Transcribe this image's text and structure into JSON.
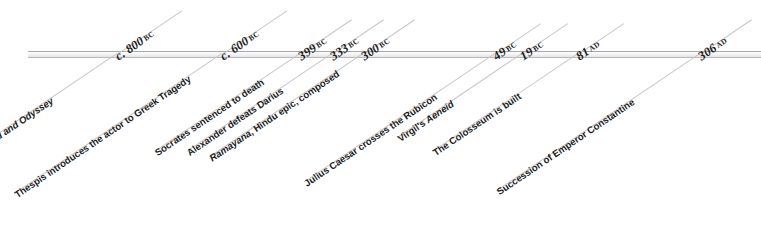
{
  "figure": {
    "axis_color": "#a9a9ad",
    "leader_color": "#c6c6ca",
    "text_color": "#1c1c1c",
    "rotation_degrees": -34
  },
  "events": [
    {
      "date_value": "c. 800",
      "era": "BC",
      "label_prefix": "Homer's ",
      "label_italic": "Iliad and Odyssey",
      "label_suffix": "",
      "label_plain": "Homer's Iliad and Odyssey"
    },
    {
      "date_value": "c. 600",
      "era": "BC",
      "label_prefix": "Thespis introduces the actor to Greek Tragedy",
      "label_italic": "",
      "label_suffix": "",
      "label_plain": "Thespis introduces the actor to Greek Tragedy"
    },
    {
      "date_value": "399",
      "era": "BC",
      "label_prefix": "Socrates sentenced to death",
      "label_italic": "",
      "label_suffix": "",
      "label_plain": "Socrates sentenced to death"
    },
    {
      "date_value": "333",
      "era": "BC",
      "label_prefix": "Alexander defeats Darius",
      "label_italic": "",
      "label_suffix": "",
      "label_plain": "Alexander defeats Darius"
    },
    {
      "date_value": "300",
      "era": "BC",
      "label_prefix": "",
      "label_italic": "Ramayana",
      "label_suffix": ", Hindu epic, composed",
      "label_plain": "Ramayana, Hindu epic, composed"
    },
    {
      "date_value": "49",
      "era": "BC",
      "label_prefix": "Julius Caesar crosses the Rubicon",
      "label_italic": "",
      "label_suffix": "",
      "label_plain": "Julius Caesar crosses the Rubicon"
    },
    {
      "date_value": "19",
      "era": "BC",
      "label_prefix": "Virgil's ",
      "label_italic": "Aeneid",
      "label_suffix": "",
      "label_plain": "Virgil's Aeneid"
    },
    {
      "date_value": "81",
      "era": "AD",
      "label_prefix": "The Colosseum is built",
      "label_italic": "",
      "label_suffix": "",
      "label_plain": "The Colosseum is built"
    },
    {
      "date_value": "306",
      "era": "AD",
      "label_prefix": "Succession of Emperor Constantine",
      "label_italic": "",
      "label_suffix": "",
      "label_plain": "Succession of Emperor Constantine"
    }
  ],
  "layout": {
    "anchor_x": [
      117,
      222,
      300,
      332,
      363,
      495,
      522,
      578,
      700
    ],
    "label_length": [
      200,
      250,
      175,
      175,
      185,
      230,
      150,
      175,
      245
    ],
    "date_length": [
      78,
      78,
      62,
      62,
      62,
      55,
      55,
      55,
      62
    ]
  }
}
